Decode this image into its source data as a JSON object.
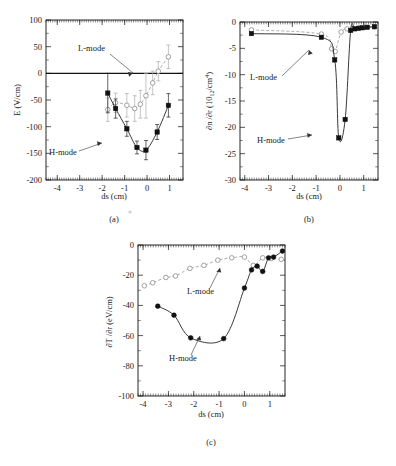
{
  "figure": {
    "panels": [
      {
        "id": "a",
        "caption": "(a)",
        "xlabel": "ds (cm)",
        "ylabel": "E  (V/cm)",
        "ylabel_sub": "r",
        "annotations": [
          {
            "label": "L-mode"
          },
          {
            "label": "H-mode"
          }
        ]
      },
      {
        "id": "b",
        "caption": "(b)",
        "xlabel": "ds (cm)",
        "ylabel_pre": "∂n /∂r  (10",
        "ylabel_sub": "e",
        "ylabel_exp": "12",
        "ylabel_post": "/cm",
        "ylabel_exp2": "4",
        "ylabel_close": ")",
        "annotations": [
          {
            "label": "L-mode"
          },
          {
            "label": "H-mode"
          }
        ]
      },
      {
        "id": "c",
        "caption": "(c)",
        "xlabel": "ds (cm)",
        "ylabel_pre": "∂T /∂r  (eV/cm)",
        "ylabel_sub": "e",
        "annotations": [
          {
            "label": "L-mode"
          },
          {
            "label": "H-mode"
          }
        ]
      }
    ]
  },
  "chart_data": [
    {
      "type": "scatter",
      "panel": "a",
      "title": "",
      "xlabel": "ds (cm)",
      "ylabel": "E_r (V/cm)",
      "xlim": [
        -4.5,
        1.6
      ],
      "ylim": [
        -200,
        100
      ],
      "xticks": [
        -4,
        -3,
        -2,
        -1,
        0,
        1
      ],
      "yticks": [
        100,
        50,
        0,
        -50,
        -100,
        -150,
        -200
      ],
      "grid": false,
      "legend": [
        "L-mode",
        "H-mode"
      ],
      "series": [
        {
          "name": "H-mode",
          "marker": "filled-square",
          "x": [
            -1.75,
            -1.4,
            -0.9,
            -0.45,
            -0.05,
            0.45,
            0.95
          ],
          "y": [
            -37,
            -66,
            -104,
            -139,
            -144,
            -110,
            -60
          ],
          "yerr": [
            37,
            18,
            14,
            12,
            18,
            14,
            22
          ]
        },
        {
          "name": "L-mode",
          "marker": "open-circle",
          "x": [
            -1.75,
            -1.4,
            -0.9,
            -0.55,
            -0.3,
            -0.05,
            0.25,
            0.5,
            0.95
          ],
          "y": [
            -68,
            -55,
            -60,
            -66,
            -58,
            -42,
            -18,
            4,
            31
          ],
          "yerr": [
            22,
            18,
            22,
            24,
            26,
            42,
            22,
            18,
            22
          ]
        }
      ]
    },
    {
      "type": "scatter",
      "panel": "b",
      "title": "",
      "xlabel": "ds (cm)",
      "ylabel": "dn_e/dr (10^12/cm^4)",
      "xlim": [
        -4.2,
        1.6
      ],
      "ylim": [
        -30,
        0
      ],
      "xticks": [
        -4,
        -3,
        -2,
        -1,
        0,
        1
      ],
      "yticks": [
        0,
        -5,
        -10,
        -15,
        -20,
        -25,
        -30
      ],
      "grid": false,
      "legend": [
        "L-mode",
        "H-mode"
      ],
      "series": [
        {
          "name": "H-mode",
          "marker": "filled-square",
          "x": [
            -3.72,
            -0.78,
            -0.22,
            -0.05,
            0.22,
            0.45,
            0.62,
            0.78,
            0.95,
            1.15,
            1.45
          ],
          "y": [
            -2.2,
            -2.9,
            -7.2,
            -22.0,
            -18.5,
            -1.6,
            -1.3,
            -1.2,
            -1.1,
            -1.0,
            -0.9
          ]
        },
        {
          "name": "L-mode",
          "marker": "open-circle",
          "x": [
            -3.72,
            -0.78,
            -0.35,
            -0.2,
            0.05,
            0.3,
            0.55,
            0.8,
            1.05,
            1.45
          ],
          "y": [
            -1.5,
            -2.3,
            -5.1,
            -5.6,
            -1.9,
            -1.3,
            -1.2,
            -1.1,
            -1.0,
            -0.9
          ]
        }
      ]
    },
    {
      "type": "scatter",
      "panel": "c",
      "title": "",
      "xlabel": "ds (cm)",
      "ylabel": "dT_e/dr (eV/cm)",
      "xlim": [
        -4.2,
        1.6
      ],
      "ylim": [
        -100,
        0
      ],
      "xticks": [
        -4,
        -3,
        -2,
        -1,
        0,
        1
      ],
      "yticks": [
        0,
        -20,
        -40,
        -60,
        -80,
        -100
      ],
      "grid": false,
      "legend": [
        "L-mode",
        "H-mode"
      ],
      "series": [
        {
          "name": "H-mode",
          "marker": "filled-circle",
          "x": [
            -3.42,
            -2.78,
            -2.12,
            -0.82,
            0.0,
            0.28,
            0.5,
            0.72,
            0.95,
            1.15,
            1.5
          ],
          "y": [
            -40.5,
            -46.5,
            -61.5,
            -62.0,
            -28.5,
            -16.5,
            -14.0,
            -17.5,
            -8.5,
            -8.0,
            -4.0
          ]
        },
        {
          "name": "L-mode",
          "marker": "open-circle",
          "x": [
            -3.95,
            -3.62,
            -3.1,
            -2.72,
            -2.15,
            -1.6,
            -1.05,
            -0.5,
            0.0,
            0.35,
            0.72,
            1.05,
            1.45
          ],
          "y": [
            -27.0,
            -25.0,
            -21.5,
            -20.5,
            -15.5,
            -13.5,
            -10.0,
            -8.5,
            -8.0,
            -13.5,
            -8.5,
            -9.0,
            -9.5
          ]
        }
      ]
    }
  ]
}
